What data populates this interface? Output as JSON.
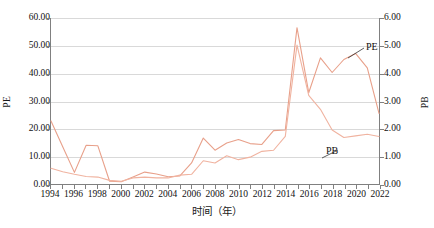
{
  "chart_data": {
    "type": "line",
    "title": "",
    "xlabel": "时间（年）",
    "ylabel": "PE",
    "ylabel_right": "PB",
    "xlim": [
      1994,
      2022
    ],
    "ylim": [
      0.0,
      60.0
    ],
    "ylim_right": [
      0.0,
      6.0
    ],
    "grid": true,
    "legend": "inline-callout",
    "x": [
      1994,
      1995,
      1996,
      1997,
      1998,
      1999,
      2000,
      2001,
      2002,
      2003,
      2004,
      2005,
      2006,
      2007,
      2008,
      2009,
      2010,
      2011,
      2012,
      2013,
      2014,
      2015,
      2016,
      2017,
      2018,
      2019,
      2020,
      2021,
      2022
    ],
    "xtick_labels": [
      "1994",
      "1996",
      "1998",
      "2000",
      "2002",
      "2004",
      "2006",
      "2008",
      "2010",
      "2012",
      "2014",
      "2016",
      "2018",
      "2020",
      "2022"
    ],
    "xtick_values": [
      1994,
      1996,
      1998,
      2000,
      2002,
      2004,
      2006,
      2008,
      2010,
      2012,
      2014,
      2016,
      2018,
      2020,
      2022
    ],
    "ytick_labels_left": [
      "0.00",
      "10.00",
      "20.00",
      "30.00",
      "40.00",
      "50.00",
      "60.00"
    ],
    "ytick_values_left": [
      0,
      10,
      20,
      30,
      40,
      50,
      60
    ],
    "ytick_labels_right": [
      "0.00",
      "1.00",
      "2.00",
      "3.00",
      "4.00",
      "5.00",
      "6.00"
    ],
    "ytick_values_right": [
      0,
      1,
      2,
      3,
      4,
      5,
      6
    ],
    "series": [
      {
        "name": "PE",
        "axis": "left",
        "color": "#e8a08a",
        "values": [
          22.8,
          13.5,
          4.2,
          14.0,
          13.8,
          1.0,
          0.8,
          2.5,
          4.3,
          3.6,
          2.6,
          2.9,
          7.6,
          16.6,
          12.2,
          14.8,
          16.1,
          14.6,
          14.3,
          19.3,
          19.5,
          56.5,
          33.0,
          45.6,
          40.3,
          45.0,
          47.2,
          42.0,
          25.5
        ]
      },
      {
        "name": "PB",
        "axis": "right",
        "color": "#f0b3a0",
        "values": [
          0.57,
          0.44,
          0.35,
          0.27,
          0.25,
          0.13,
          0.1,
          0.22,
          0.25,
          0.22,
          0.22,
          0.32,
          0.35,
          0.84,
          0.76,
          1.02,
          0.88,
          0.97,
          1.18,
          1.22,
          1.72,
          5.02,
          3.2,
          2.7,
          1.95,
          1.68,
          1.74,
          1.8,
          1.72
        ]
      }
    ],
    "annotations": [
      {
        "text": "PE",
        "target_series": "PE"
      },
      {
        "text": "PB",
        "target_series": "PB"
      }
    ]
  },
  "axes": {
    "left_title": "PE",
    "right_title": "PB",
    "x_title": "时间（年）"
  },
  "labels": {
    "pe": "PE",
    "pb": "PB"
  },
  "colors": {
    "pe_line": "#e8a08a",
    "pb_line": "#f0b3a0",
    "grid": "#d9d9d9",
    "axis": "#808080",
    "background": "#ffffff",
    "text": "#111111"
  }
}
